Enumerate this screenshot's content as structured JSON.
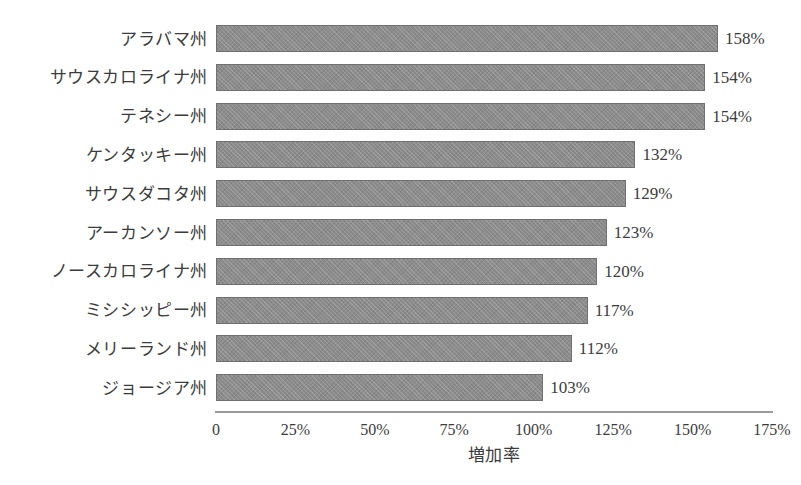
{
  "chart_data": {
    "type": "bar",
    "orientation": "horizontal",
    "title": "",
    "xlabel": "増加率",
    "ylabel": "",
    "xlim": [
      0,
      175
    ],
    "grid": false,
    "legend": null,
    "bar_color": "#8c8c8c",
    "bar_border_color": "#707070",
    "background_color": "#ffffff",
    "text_color": "#3c3c3c",
    "axis_color": "#9a9a9a",
    "value_suffix": "%",
    "xticks": [
      0,
      25,
      50,
      75,
      100,
      125,
      150,
      175
    ],
    "xtick_labels": [
      "0",
      "25%",
      "50%",
      "75%",
      "100%",
      "125%",
      "150%",
      "175%"
    ],
    "categories": [
      "アラバマ州",
      "サウスカロライナ州",
      "テネシー州",
      "ケンタッキー州",
      "サウスダコタ州",
      "アーカンソー州",
      "ノースカロライナ州",
      "ミシシッピー州",
      "メリーランド州",
      "ジョージア州"
    ],
    "values": [
      158,
      154,
      154,
      132,
      129,
      123,
      120,
      117,
      112,
      103
    ],
    "value_labels": [
      "158%",
      "154%",
      "154%",
      "132%",
      "129%",
      "123%",
      "120%",
      "117%",
      "112%",
      "103%"
    ],
    "bars": [
      {
        "category": "アラバマ州",
        "value": 158,
        "label": "158%"
      },
      {
        "category": "サウスカロライナ州",
        "value": 154,
        "label": "154%"
      },
      {
        "category": "テネシー州",
        "value": 154,
        "label": "154%"
      },
      {
        "category": "ケンタッキー州",
        "value": 132,
        "label": "132%"
      },
      {
        "category": "サウスダコタ州",
        "value": 129,
        "label": "129%"
      },
      {
        "category": "アーカンソー州",
        "value": 123,
        "label": "123%"
      },
      {
        "category": "ノースカロライナ州",
        "value": 120,
        "label": "120%"
      },
      {
        "category": "ミシシッピー州",
        "value": 117,
        "label": "117%"
      },
      {
        "category": "メリーランド州",
        "value": 112,
        "label": "112%"
      },
      {
        "category": "ジョージア州",
        "value": 103,
        "label": "103%"
      }
    ]
  }
}
